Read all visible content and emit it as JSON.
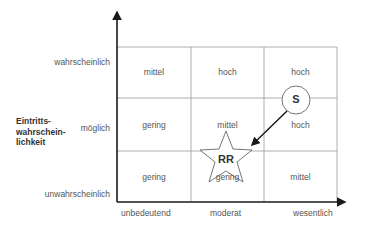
{
  "diagram": {
    "y_axis": {
      "title_lines": [
        "Eintritts-",
        "wahrschein-",
        "lichkeit"
      ],
      "levels": [
        "wahrscheinlich",
        "möglich",
        "unwahrscheinlich"
      ]
    },
    "x_axis": {
      "levels": [
        "unbedeutend",
        "moderat",
        "wesentlich"
      ]
    },
    "grid": {
      "rows": [
        [
          "mittel",
          "hoch",
          "hoch"
        ],
        [
          "gering",
          "mittel",
          "hoch"
        ],
        [
          "gering",
          "gering",
          "mittel"
        ]
      ]
    },
    "markers": {
      "start": {
        "label": "S",
        "shape": "circle"
      },
      "end": {
        "label": "RR",
        "shape": "star"
      }
    },
    "colors": {
      "axis": "#1a1a1a",
      "grid": "#888888",
      "text": "#555555"
    }
  }
}
